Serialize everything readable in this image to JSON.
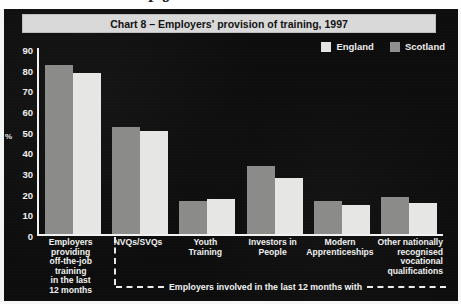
{
  "page": {
    "cut_off_header_fragment": "P 8"
  },
  "figure": {
    "title": "Chart 8 – Employers' provision of training, 1997",
    "y_axis_label": "%",
    "footnote": "Employers involved in the last 12 months with"
  },
  "legend": {
    "items": [
      {
        "label": "England",
        "color": "#e6e6e4"
      },
      {
        "label": "Scotland",
        "color": "#8b8b89"
      }
    ]
  },
  "chart_data": {
    "type": "bar",
    "title": "Chart 8 – Employers' provision of training, 1997",
    "xlabel": "",
    "ylabel": "%",
    "ylim": [
      0,
      90
    ],
    "yticks": [
      0,
      10,
      20,
      30,
      40,
      50,
      60,
      70,
      80,
      90
    ],
    "grid": false,
    "legend_position": "top-right",
    "annotation": "Employers involved in the last 12 months with",
    "categories": [
      "Employers providing off-the-job training in the last 12 months",
      "NVQs/SVQs",
      "Youth Training",
      "Investors in People",
      "Modern Apprenticeships",
      "Other nationally recognised vocational qualifications"
    ],
    "category_lines": [
      [
        "Employers",
        "providing",
        "off-the-job",
        "training",
        "in the last",
        "12 months"
      ],
      [
        "NVQs/SVQs"
      ],
      [
        "Youth",
        "Training"
      ],
      [
        "Investors in",
        "People"
      ],
      [
        "Modern",
        "Apprenticeships"
      ],
      [
        "Other nationally",
        "recognised",
        "vocational",
        "qualifications"
      ]
    ],
    "series": [
      {
        "name": "Scotland",
        "color": "#8b8b89",
        "values": [
          82,
          52,
          16,
          33,
          16,
          18
        ]
      },
      {
        "name": "England",
        "color": "#e6e6e4",
        "values": [
          78,
          50,
          17,
          27,
          14,
          15
        ]
      }
    ]
  }
}
